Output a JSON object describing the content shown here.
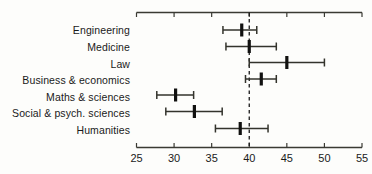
{
  "chart_data": {
    "type": "errorbar",
    "title": "",
    "subtitle": "",
    "xlabel": "",
    "ylabel": "",
    "orientation": "horizontal",
    "xlim": [
      25,
      55
    ],
    "x_ticks": [
      25,
      30,
      35,
      40,
      45,
      50,
      55
    ],
    "x_tick_labels": [
      "25",
      "30",
      "35",
      "40",
      "45",
      "50",
      "55"
    ],
    "grid": false,
    "legend": "none",
    "reference_line": {
      "value": 40,
      "style": "dashed",
      "color": "#1a1a1a",
      "label": ""
    },
    "axes": {
      "top_axis": true,
      "bottom_axis": true,
      "left_spine": false,
      "right_spine": false
    },
    "categories": [
      "Engineering",
      "Medicine",
      "Law",
      "Business & economics",
      "Maths & sciences",
      "Social & psych. sciences",
      "Humanities"
    ],
    "series": [
      {
        "name": "estimate",
        "values": [
          39.0,
          40.0,
          45.0,
          41.6,
          30.2,
          32.7,
          38.8
        ],
        "ci_low": [
          36.5,
          36.9,
          40.0,
          39.5,
          27.7,
          28.9,
          35.5
        ],
        "ci_high": [
          41.0,
          43.6,
          50.0,
          43.6,
          32.6,
          36.4,
          42.5
        ]
      }
    ],
    "marker_style": "thick-vertical-bar",
    "whisker_style": "capped-line",
    "line_color": "#2b2b26",
    "marker_color": "#111110"
  },
  "colors": {
    "background": "#fdfdfb",
    "axis": "#3a3a33",
    "text": "#1a1a1a",
    "marker": "#111110",
    "whisker": "#33332c"
  }
}
